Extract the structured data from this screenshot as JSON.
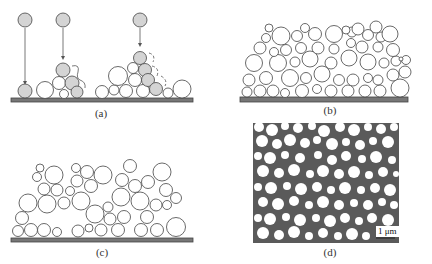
{
  "figure": {
    "panels": [
      {
        "id": "a",
        "label": "(a)",
        "description": "Particles falling one by one onto substrate and rolling to stable positions"
      },
      {
        "id": "b",
        "label": "(b)",
        "description": "Dense packing of spherical particles on substrate"
      },
      {
        "id": "c",
        "label": "(c)",
        "description": "Loose packing of spherical particles with voids on substrate"
      },
      {
        "id": "d",
        "label": "(d)",
        "description": "Micrograph of particle packing",
        "scale_bar": "1 μm"
      }
    ],
    "colors": {
      "substrate": "#777777",
      "gray_particle": "#d4d4d4",
      "outline": "#444444",
      "micrograph_bg": "#5a5a5a",
      "micrograph_particle": "#ffffff"
    }
  }
}
